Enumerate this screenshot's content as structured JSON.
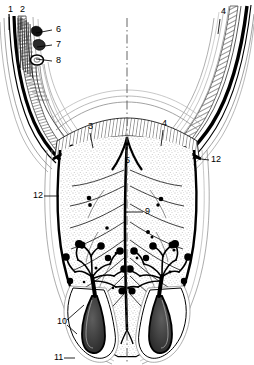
{
  "figure": {
    "background_color": "#ffffff",
    "ink_color": "#000000",
    "stipple_color": "#7a7a7a",
    "hatch_color": "#555555"
  },
  "axis": {
    "name": "midline-axis",
    "style": "dash-dot vertical centerline",
    "x": 127,
    "y_top": 18,
    "y_bottom": 362
  },
  "callouts": [
    {
      "id": "1",
      "label": "1",
      "x": 8,
      "y": 10,
      "leader": [
        [
          9,
          17
        ],
        [
          9,
          30
        ]
      ]
    },
    {
      "id": "2",
      "label": "2",
      "x": 20,
      "y": 10,
      "leader": [
        [
          21,
          17
        ],
        [
          21,
          30
        ]
      ]
    },
    {
      "id": "6",
      "label": "6",
      "x": 56,
      "y": 30,
      "leader": [
        [
          52,
          30
        ],
        [
          36,
          33
        ]
      ]
    },
    {
      "id": "7",
      "label": "7",
      "x": 56,
      "y": 45,
      "leader": [
        [
          52,
          45
        ],
        [
          37,
          47
        ]
      ]
    },
    {
      "id": "8",
      "label": "8",
      "x": 56,
      "y": 61,
      "leader": [
        [
          52,
          61
        ],
        [
          36,
          59
        ]
      ]
    },
    {
      "id": "4t",
      "label": "4",
      "x": 221,
      "y": 12,
      "leader": [
        [
          220,
          19
        ],
        [
          218,
          34
        ]
      ]
    },
    {
      "id": "3",
      "label": "3",
      "x": 88,
      "y": 127,
      "leader": [
        [
          90,
          133
        ],
        [
          93,
          148
        ]
      ]
    },
    {
      "id": "4b",
      "label": "4",
      "x": 162,
      "y": 124,
      "leader": [
        [
          163,
          130
        ],
        [
          161,
          146
        ]
      ]
    },
    {
      "id": "5",
      "label": "5",
      "x": 125,
      "y": 161,
      "leader": []
    },
    {
      "id": "12r",
      "label": "12",
      "x": 211,
      "y": 160,
      "leader": [
        [
          209,
          160
        ],
        [
          193,
          158
        ]
      ]
    },
    {
      "id": "12l",
      "label": "12",
      "x": 33,
      "y": 196,
      "leader": [
        [
          44,
          196
        ],
        [
          59,
          196
        ]
      ]
    },
    {
      "id": "9",
      "label": "9",
      "x": 145,
      "y": 212,
      "leader": [
        [
          143,
          212
        ],
        [
          126,
          212
        ]
      ]
    },
    {
      "id": "10",
      "label": "10",
      "x": 57,
      "y": 322,
      "leader": [
        [
          67,
          320
        ],
        [
          84,
          305
        ]
      ],
      "leader2": [
        [
          67,
          325
        ],
        [
          77,
          334
        ]
      ]
    },
    {
      "id": "11",
      "label": "11",
      "x": 54,
      "y": 358,
      "leader": [
        [
          64,
          358
        ],
        [
          75,
          358
        ]
      ]
    }
  ]
}
